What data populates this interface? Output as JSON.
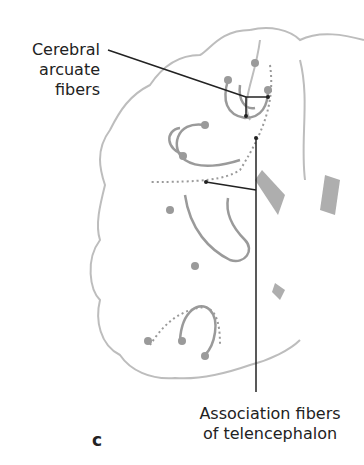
{
  "figure": {
    "panel_letter": "c",
    "labels": [
      {
        "lines": [
          "Cerebral",
          "arcuate",
          "fibers"
        ]
      },
      {
        "lines": [
          "Association fibers",
          "of telencephalon"
        ]
      }
    ],
    "colors": {
      "outline": "#bdbdbd",
      "fiber": "#9a9a9a",
      "leader": "#222222",
      "ventricle": "#8c8c8c"
    }
  }
}
